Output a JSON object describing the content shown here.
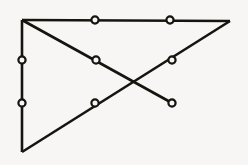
{
  "figure": {
    "kind": "line-drawing",
    "canvas": {
      "width": 248,
      "height": 165
    },
    "background_color": "#f7f6f4",
    "line_color": "#17140f",
    "node_fill_color": "#f7f6f4",
    "node_stroke_color": "#17140f",
    "edge_stroke_width": 2.6,
    "node_radius": 3.6,
    "node_stroke_width": 2.2,
    "points": [
      {
        "id": "A",
        "name": "top-left-corner",
        "x": 22,
        "y": 20,
        "marked": false
      },
      {
        "id": "B",
        "name": "top-edge-mid-left",
        "x": 95,
        "y": 20,
        "marked": true
      },
      {
        "id": "C",
        "name": "top-edge-mid-right",
        "x": 170,
        "y": 20,
        "marked": true
      },
      {
        "id": "D",
        "name": "top-right-corner",
        "x": 230,
        "y": 21,
        "marked": false
      },
      {
        "id": "E",
        "name": "left-edge-upper",
        "x": 22,
        "y": 60,
        "marked": true
      },
      {
        "id": "F",
        "name": "left-edge-lower",
        "x": 22,
        "y": 103,
        "marked": true
      },
      {
        "id": "G",
        "name": "bottom-left-corner",
        "x": 22,
        "y": 152,
        "marked": false
      },
      {
        "id": "H",
        "name": "descending-diagonal-upper",
        "x": 96,
        "y": 60,
        "marked": true
      },
      {
        "id": "I",
        "name": "descending-diagonal-endpoint",
        "x": 172,
        "y": 103,
        "marked": true
      },
      {
        "id": "J",
        "name": "ascending-diagonal-lower",
        "x": 95,
        "y": 103,
        "marked": true
      },
      {
        "id": "K",
        "name": "ascending-diagonal-upper",
        "x": 172,
        "y": 60,
        "marked": true
      },
      {
        "id": "X",
        "name": "diagonal-crossing-point",
        "x": 134,
        "y": 82,
        "marked": false
      }
    ],
    "edges": [
      {
        "id": "edge-top",
        "name": "top-horizontal-edge",
        "from": "A",
        "to": "D"
      },
      {
        "id": "edge-left",
        "name": "left-vertical-edge",
        "from": "A",
        "to": "G"
      },
      {
        "id": "edge-descending",
        "name": "descending-diagonal-edge",
        "from": "A",
        "to": "I"
      },
      {
        "id": "edge-ascending",
        "name": "ascending-diagonal-edge",
        "from": "G",
        "to": "D"
      }
    ],
    "marked_node_count": 8,
    "edge_count": 4
  }
}
